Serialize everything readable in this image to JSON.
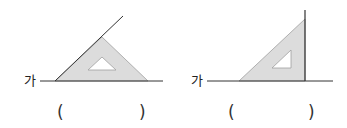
{
  "figures": [
    {
      "line_label": "가",
      "answer_open": "(",
      "answer_close": ")",
      "answer_value": ""
    },
    {
      "line_label": "가",
      "answer_open": "(",
      "answer_close": ")",
      "answer_value": ""
    }
  ],
  "colors": {
    "triangle_fill": "#dcdcdc",
    "triangle_stroke": "#9a9a9a",
    "line": "#333333"
  }
}
